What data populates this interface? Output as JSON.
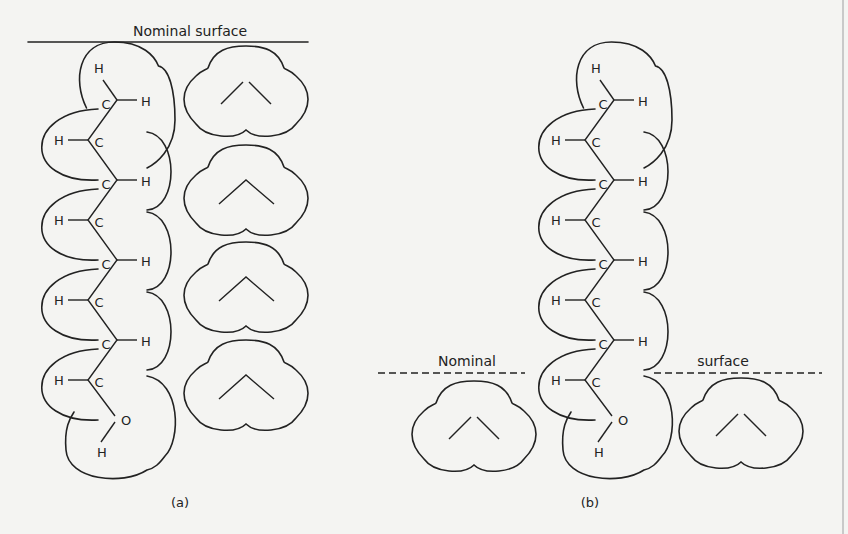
{
  "figure": {
    "panel_a": {
      "caption": "(a)",
      "surface_label": "Nominal surface",
      "chain_atoms": {
        "carbon": "C",
        "hydrogen": "H",
        "oxygen": "O"
      },
      "water_molecules": 4,
      "water_labels": {
        "oxygen": "O",
        "hydrogen": "H"
      }
    },
    "panel_b": {
      "caption": "(b)",
      "surface_label_left": "Nominal",
      "surface_label_right": "surface",
      "chain_atoms": {
        "carbon": "C",
        "hydrogen": "H",
        "oxygen": "O"
      },
      "water_molecules": 2,
      "water_labels": {
        "oxygen": "O",
        "hydrogen": "H"
      }
    },
    "chain_carbon_count": 8
  }
}
